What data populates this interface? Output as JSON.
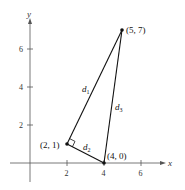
{
  "figure": {
    "axes": {
      "x_label": "x",
      "y_label": "y",
      "x_ticks": [
        "2",
        "4",
        "6"
      ],
      "y_ticks": [
        "2",
        "4",
        "6"
      ]
    },
    "points": [
      {
        "label": "(5, 7)",
        "x": 5,
        "y": 7
      },
      {
        "label": "(2, 1)",
        "x": 2,
        "y": 1
      },
      {
        "label": "(4, 0)",
        "x": 4,
        "y": 0
      }
    ],
    "segments": [
      {
        "name": "d",
        "sub": "1",
        "from": "(2, 1)",
        "to": "(5, 7)"
      },
      {
        "name": "d",
        "sub": "2",
        "from": "(2, 1)",
        "to": "(4, 0)"
      },
      {
        "name": "d",
        "sub": "3",
        "from": "(4, 0)",
        "to": "(5, 7)"
      }
    ],
    "right_angle_at": "(2, 1)",
    "colors": {
      "axis": "#555555",
      "line": "#111111"
    }
  }
}
